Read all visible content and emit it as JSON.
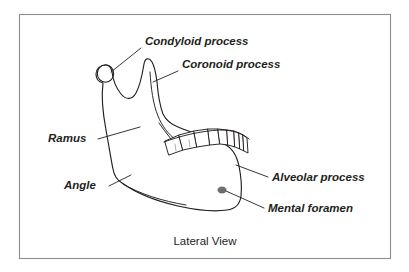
{
  "figure": {
    "title_caption": "Lateral View",
    "frame": {
      "x": 19,
      "y": 14,
      "width": 371,
      "height": 244,
      "border_color": "#8d8d8e"
    },
    "colors": {
      "background": "#ffffff",
      "outline": "#231f20",
      "shading": "#b9b9ba",
      "shading_soft": "#cfcfd0",
      "foramen": "#6e6e70",
      "text": "#231f20"
    },
    "labels": [
      {
        "id": "condyloid-process",
        "text": "Condyloid process",
        "text_x": 145,
        "text_y": 45,
        "anchor": "start",
        "leader": "M 141,48 L 111,72"
      },
      {
        "id": "coronoid-process",
        "text": "Coronoid process",
        "text_x": 182,
        "text_y": 68,
        "anchor": "start",
        "leader": "M 178,71 L 153,82"
      },
      {
        "id": "ramus",
        "text": "Ramus",
        "text_x": 48,
        "text_y": 142,
        "anchor": "start",
        "leader": "M 98,139 L 140,127"
      },
      {
        "id": "angle",
        "text": "Angle",
        "text_x": 64,
        "text_y": 189,
        "anchor": "start",
        "leader": "M 109,186 L 131,175"
      },
      {
        "id": "alveolar-process",
        "text": "Alveolar process",
        "text_x": 272,
        "text_y": 181,
        "anchor": "start",
        "leader": "M 268,177 L 236,165"
      },
      {
        "id": "mental-foramen",
        "text": "Mental foramen",
        "text_x": 268,
        "text_y": 212,
        "anchor": "start",
        "leader": "M 264,208 L 226,191"
      }
    ],
    "caption": {
      "text": "Lateral View",
      "x": 205,
      "y": 245
    },
    "anatomy": {
      "condyle_center_x": 106,
      "condyle_center_y": 72,
      "coronoid_apex_x": 152,
      "coronoid_apex_y": 62,
      "angle_x": 120,
      "angle_y": 176,
      "mental_foramen_x": 222,
      "mental_foramen_y": 190,
      "tooth_count": 9
    }
  }
}
